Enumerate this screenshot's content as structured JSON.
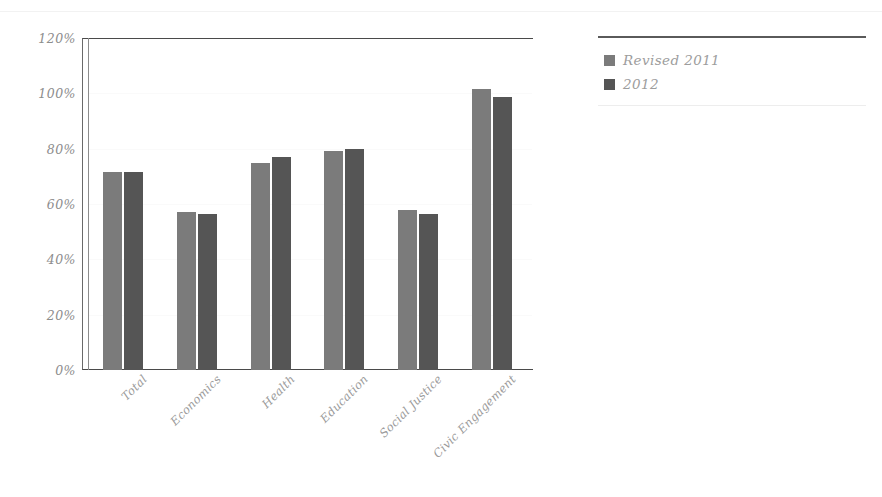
{
  "chart_data": {
    "type": "bar",
    "title": "",
    "subtitle": "",
    "xlabel": "",
    "ylabel": "",
    "categories": [
      "Total",
      "Economics",
      "Health",
      "Education",
      "Social Justice",
      "Civic Engagement"
    ],
    "series": [
      {
        "name": "Revised 2011",
        "color": "#7b7b7b",
        "values": [
          71.5,
          57.0,
          75.0,
          79.0,
          58.0,
          101.5
        ]
      },
      {
        "name": "2012",
        "color": "#555555",
        "values": [
          71.5,
          56.5,
          77.0,
          80.0,
          56.5,
          98.5
        ]
      }
    ],
    "ylim": [
      0,
      120
    ],
    "yticks": [
      0,
      20,
      40,
      60,
      80,
      100,
      120
    ],
    "ytick_labels": [
      "0%",
      "20%",
      "40%",
      "60%",
      "80%",
      "100%",
      "120%"
    ],
    "grid": "faint-horizontal",
    "legend_position": "right",
    "value_format": "percent"
  },
  "legend": {
    "items": [
      {
        "label": "Revised 2011",
        "swatch": "legend-swatch-revised-2011"
      },
      {
        "label": "2012",
        "swatch": "legend-swatch-2012"
      }
    ]
  },
  "colors": {
    "series_2011": "#7b7b7b",
    "series_2012": "#555555",
    "axis": "#4a4a4a",
    "tick_text": "#8d8d8d",
    "label_text": "#9a9a9a",
    "legend_text": "#9d9d9d"
  }
}
